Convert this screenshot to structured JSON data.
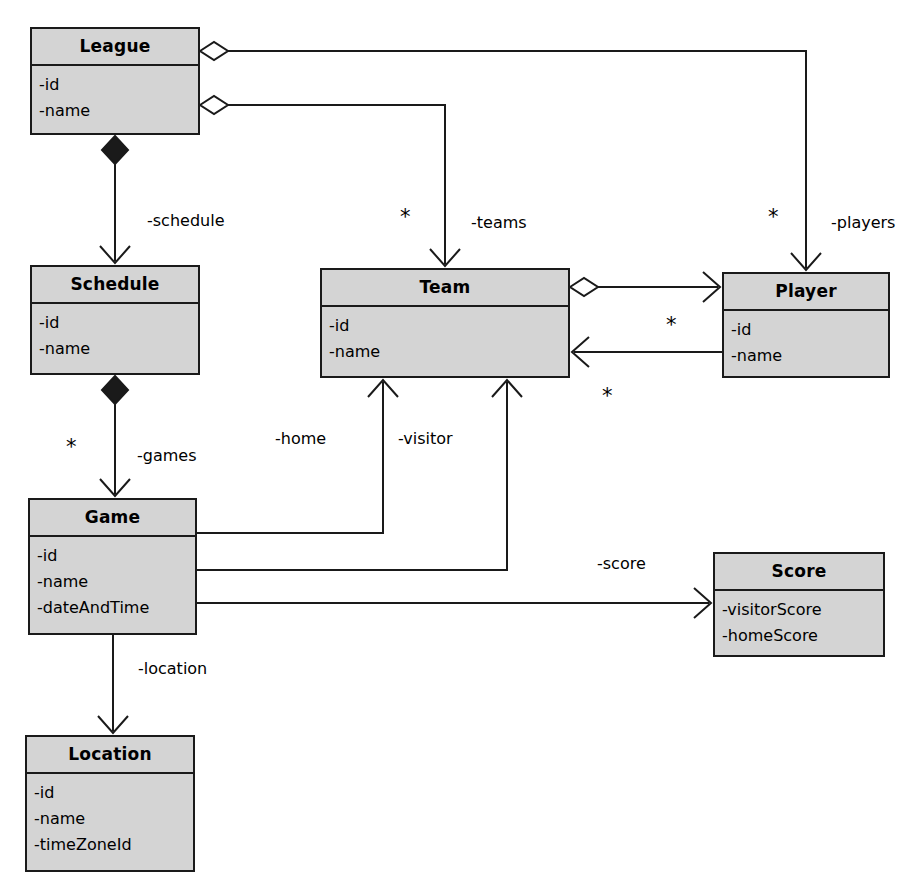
{
  "diagram": {
    "kind": "uml-class-diagram",
    "colors": {
      "class_fill": "#d4d4d4",
      "stroke": "#1a1a1a",
      "background": "#ffffff",
      "text": "#000000"
    },
    "classes": [
      {
        "id": "league",
        "name": "League",
        "attributes": [
          "-id",
          "-name"
        ],
        "x": 30,
        "y": 27,
        "w": 170,
        "h": 108
      },
      {
        "id": "schedule",
        "name": "Schedule",
        "attributes": [
          "-id",
          "-name"
        ],
        "x": 30,
        "y": 265,
        "w": 170,
        "h": 110
      },
      {
        "id": "team",
        "name": "Team",
        "attributes": [
          "-id",
          "-name"
        ],
        "x": 320,
        "y": 268,
        "w": 250,
        "h": 110
      },
      {
        "id": "player",
        "name": "Player",
        "attributes": [
          "-id",
          "-name"
        ],
        "x": 722,
        "y": 272,
        "w": 168,
        "h": 106
      },
      {
        "id": "game",
        "name": "Game",
        "attributes": [
          "-id",
          "-name",
          "-dateAndTime"
        ],
        "x": 28,
        "y": 498,
        "w": 169,
        "h": 137
      },
      {
        "id": "score",
        "name": "Score",
        "attributes": [
          "-visitorScore",
          "-homeScore"
        ],
        "x": 713,
        "y": 552,
        "w": 172,
        "h": 105
      },
      {
        "id": "location",
        "name": "Location",
        "attributes": [
          "-id",
          "-name",
          "-timeZoneId"
        ],
        "x": 25,
        "y": 735,
        "w": 170,
        "h": 137
      }
    ],
    "relationships": [
      {
        "id": "league-players",
        "from": "League",
        "to": "Player",
        "type": "aggregation",
        "role_label": "-players",
        "multiplicity": "*"
      },
      {
        "id": "league-teams",
        "from": "League",
        "to": "Team",
        "type": "aggregation",
        "role_label": "-teams",
        "multiplicity": "*"
      },
      {
        "id": "league-schedule",
        "from": "League",
        "to": "Schedule",
        "type": "composition",
        "role_label": "-schedule",
        "multiplicity": ""
      },
      {
        "id": "schedule-games",
        "from": "Schedule",
        "to": "Game",
        "type": "composition",
        "role_label": "-games",
        "multiplicity": "*"
      },
      {
        "id": "team-players",
        "from": "Team",
        "to": "Player",
        "type": "aggregation",
        "role_label": "",
        "multiplicity": "*"
      },
      {
        "id": "player-team",
        "from": "Player",
        "to": "Team",
        "type": "association",
        "role_label": "",
        "multiplicity": "*"
      },
      {
        "id": "game-home",
        "from": "Game",
        "to": "Team",
        "type": "association",
        "role_label": "-home",
        "multiplicity": ""
      },
      {
        "id": "game-visitor",
        "from": "Game",
        "to": "Team",
        "type": "association",
        "role_label": "-visitor",
        "multiplicity": ""
      },
      {
        "id": "game-score",
        "from": "Game",
        "to": "Score",
        "type": "association",
        "role_label": "-score",
        "multiplicity": ""
      },
      {
        "id": "game-location",
        "from": "Game",
        "to": "Location",
        "type": "association",
        "role_label": "-location",
        "multiplicity": ""
      }
    ],
    "labels": {
      "schedule_role": "-schedule",
      "teams_role": "-teams",
      "players_role": "-players",
      "games_role": "-games",
      "home_role": "-home",
      "visitor_role": "-visitor",
      "score_role": "-score",
      "location_role": "-location",
      "star_teams": "*",
      "star_players": "*",
      "star_games": "*",
      "star_team_player": "*",
      "star_player_team": "*"
    },
    "classnames": {
      "league": "League",
      "schedule": "Schedule",
      "team": "Team",
      "player": "Player",
      "game": "Game",
      "score": "Score",
      "location": "Location"
    },
    "attrs": {
      "id": "-id",
      "name": "-name",
      "dateAndTime": "-dateAndTime",
      "timeZoneId": "-timeZoneId",
      "visitorScore": "-visitorScore",
      "homeScore": "-homeScore"
    }
  }
}
